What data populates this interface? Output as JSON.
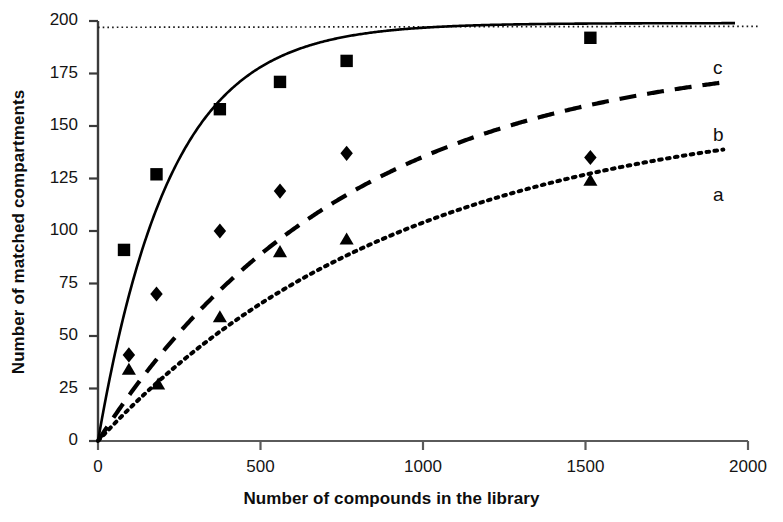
{
  "chart_data": {
    "type": "scatter",
    "title": "",
    "xlabel": "Number of compounds in the library",
    "ylabel": "Number of matched compartments",
    "xlim": [
      0,
      2000
    ],
    "ylim": [
      0,
      200
    ],
    "xticks": [
      0,
      500,
      1000,
      1500,
      2000
    ],
    "yticks": [
      0,
      25,
      50,
      75,
      100,
      125,
      150,
      175,
      200
    ],
    "grid": false,
    "legend_position": "inline-right",
    "asymptote": {
      "value": 197,
      "style": "fine-dotted",
      "label": ""
    },
    "series": [
      {
        "name": "c",
        "label": "c",
        "marker": "square",
        "line_style": "solid",
        "asymptote": 199,
        "rate_constant": 0.0045,
        "points": [
          {
            "x": 80,
            "y": 91
          },
          {
            "x": 180,
            "y": 127
          },
          {
            "x": 375,
            "y": 158
          },
          {
            "x": 560,
            "y": 171
          },
          {
            "x": 765,
            "y": 181
          },
          {
            "x": 1515,
            "y": 192
          }
        ]
      },
      {
        "name": "b",
        "label": "b",
        "marker": "diamond",
        "line_style": "dashed",
        "asymptote": 186,
        "rate_constant": 0.0013,
        "points": [
          {
            "x": 95,
            "y": 41
          },
          {
            "x": 180,
            "y": 70
          },
          {
            "x": 375,
            "y": 100
          },
          {
            "x": 560,
            "y": 119
          },
          {
            "x": 765,
            "y": 137
          },
          {
            "x": 1515,
            "y": 135
          }
        ]
      },
      {
        "name": "a",
        "label": "a",
        "marker": "triangle",
        "line_style": "dotted",
        "asymptote": 160,
        "rate_constant": 0.00105,
        "points": [
          {
            "x": 95,
            "y": 34
          },
          {
            "x": 185,
            "y": 27
          },
          {
            "x": 375,
            "y": 59
          },
          {
            "x": 560,
            "y": 90
          },
          {
            "x": 765,
            "y": 96
          },
          {
            "x": 1515,
            "y": 124
          }
        ]
      }
    ]
  },
  "axes": {
    "x_title": "Number of compounds in the library",
    "y_title": "Number of matched compartments",
    "x_tick_labels": [
      "0",
      "500",
      "1000",
      "1500",
      "2000"
    ],
    "y_tick_labels": [
      "0",
      "25",
      "50",
      "75",
      "100",
      "125",
      "150",
      "175",
      "200"
    ]
  },
  "curve_labels": [
    {
      "text": "c"
    },
    {
      "text": "b"
    },
    {
      "text": "a"
    }
  ],
  "colors": {
    "line": "#000000",
    "marker": "#000000",
    "axis": "#333333",
    "background": "#ffffff",
    "text": "#111111"
  }
}
